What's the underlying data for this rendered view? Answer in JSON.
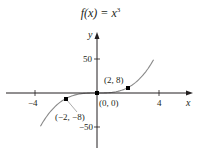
{
  "chart_data": {
    "type": "line",
    "title_prefix": "f(x) = x",
    "title_exponent": "3",
    "function": "x^3",
    "xlabel": "x",
    "ylabel": "y",
    "xlim": [
      -5.9,
      6.1
    ],
    "ylim": [
      -80,
      87
    ],
    "x_ticks": [
      -4,
      4
    ],
    "x_tick_labels": [
      "−4",
      "4"
    ],
    "y_ticks": [
      50,
      -50
    ],
    "y_tick_labels": [
      "50",
      "−50"
    ],
    "grid": false,
    "legend": null,
    "series": [
      {
        "name": "f(x) = x^3",
        "x": [
          -3.6,
          -3,
          -2.5,
          -2,
          -1.5,
          -1,
          -0.5,
          0,
          0.5,
          1,
          1.5,
          2,
          2.5,
          3,
          3.6
        ],
        "values": [
          -46.66,
          -27,
          -15.63,
          -8,
          -3.38,
          -1,
          -0.13,
          0,
          0.13,
          1,
          3.38,
          8,
          15.63,
          27,
          46.66
        ]
      }
    ],
    "points": [
      {
        "x": -2,
        "y": -8,
        "label": "(−2, −8)"
      },
      {
        "x": 0,
        "y": 0,
        "label": "(0, 0)"
      },
      {
        "x": 2,
        "y": 8,
        "label": "(2, 8)"
      }
    ],
    "colors": {
      "axis": "#231f20",
      "curve": "#8a8a8a",
      "point": "#000000"
    }
  }
}
